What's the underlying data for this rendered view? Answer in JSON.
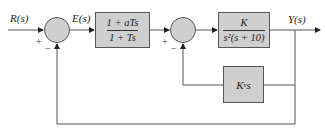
{
  "diagram": {
    "type": "feedback-control-block-diagram",
    "signals": {
      "input": "R(s)",
      "error": "E(s)",
      "output": "Y(s)"
    },
    "summing_junctions": [
      {
        "id": "sum1",
        "signs": {
          "plus": "+",
          "minus": "−"
        }
      },
      {
        "id": "sum2",
        "signs": {
          "plus": "+",
          "minus": "−"
        }
      }
    ],
    "blocks": {
      "compensator": {
        "numerator": "1 + aTs",
        "denominator": "1 + Ts"
      },
      "plant": {
        "numerator": "K",
        "denominator": "s²(s + 10)"
      },
      "velocity_feedback": {
        "label": "K",
        "subscript": "v",
        "suffix": "s"
      }
    },
    "colors": {
      "block_fill": "#cfcfcf",
      "line": "#555555",
      "background": "#ffffff"
    }
  }
}
